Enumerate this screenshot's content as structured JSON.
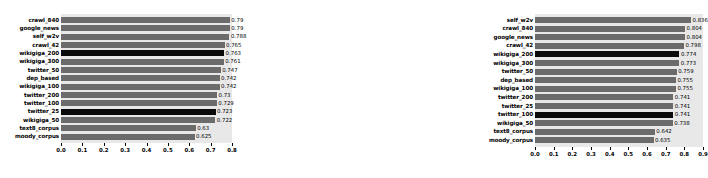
{
  "chart_data": [
    {
      "type": "bar",
      "orientation": "horizontal",
      "title": "",
      "xlabel": "",
      "ylabel": "",
      "xlim": [
        0.0,
        0.8
      ],
      "xticks": [
        "0.0",
        "0.1",
        "0.2",
        "0.3",
        "0.4",
        "0.5",
        "0.6",
        "0.7",
        "0.8"
      ],
      "grid": false,
      "legend": "none",
      "plot_background": "#e8e8e8",
      "bar_color": "#6b6b6b",
      "highlight_color": "#0a0a0a",
      "categories": [
        "crawl_840",
        "google_news",
        "self_w2v",
        "crawl_42",
        "wikigiga_200",
        "wikigiga_300",
        "twitter_50",
        "dep_based",
        "wikigiga_100",
        "twitter_200",
        "twitter_100",
        "twitter_25",
        "wikigiga_50",
        "text8_corpus",
        "moody_corpus"
      ],
      "values": [
        0.79,
        0.79,
        0.788,
        0.765,
        0.763,
        0.761,
        0.747,
        0.742,
        0.742,
        0.73,
        0.729,
        0.723,
        0.722,
        0.63,
        0.625
      ],
      "value_labels": [
        "0.79",
        "0.79",
        "0.788",
        "0.765",
        "0.763",
        "0.761",
        "0.747",
        "0.742",
        "0.742",
        "0.73",
        "0.729",
        "0.723",
        "0.722",
        "0.63",
        "0.625"
      ],
      "highlighted": [
        false,
        false,
        false,
        false,
        true,
        false,
        false,
        false,
        false,
        false,
        false,
        true,
        false,
        false,
        false
      ]
    },
    {
      "type": "bar",
      "orientation": "horizontal",
      "title": "",
      "xlabel": "",
      "ylabel": "",
      "xlim": [
        0.0,
        0.9
      ],
      "xticks": [
        "0.0",
        "0.1",
        "0.2",
        "0.3",
        "0.4",
        "0.5",
        "0.6",
        "0.7",
        "0.8",
        "0.9"
      ],
      "grid": false,
      "legend": "none",
      "plot_background": "#e8e8e8",
      "bar_color": "#6b6b6b",
      "highlight_color": "#0a0a0a",
      "categories": [
        "self_w2v",
        "crawl_840",
        "google_news",
        "crawl_42",
        "wikigiga_200",
        "wikigiga_300",
        "twitter_50",
        "dep_based",
        "wikigiga_100",
        "twitter_200",
        "twitter_25",
        "twitter_100",
        "wikigiga_50",
        "text8_corpus",
        "moody_corpus"
      ],
      "values": [
        0.836,
        0.804,
        0.804,
        0.798,
        0.774,
        0.773,
        0.759,
        0.755,
        0.755,
        0.741,
        0.741,
        0.741,
        0.738,
        0.642,
        0.635
      ],
      "value_labels": [
        "0.836",
        "0.804",
        "0.804",
        "0.798",
        "0.774",
        "0.773",
        "0.759",
        "0.755",
        "0.755",
        "0.741",
        "0.741",
        "0.741",
        "0.738",
        "0.642",
        "0.635"
      ],
      "highlighted": [
        false,
        false,
        false,
        false,
        true,
        false,
        false,
        false,
        false,
        false,
        false,
        true,
        false,
        false,
        false
      ]
    }
  ]
}
